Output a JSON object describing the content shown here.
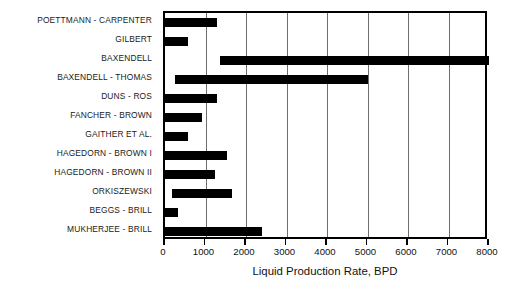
{
  "chart_data": {
    "type": "bar",
    "orientation": "horizontal",
    "title": "",
    "xlabel": "Liquid Production Rate, BPD",
    "ylabel": "",
    "xlim": [
      0,
      8000
    ],
    "xticks": [
      0,
      1000,
      2000,
      3000,
      4000,
      5000,
      6000,
      7000,
      8000
    ],
    "xticklabels": [
      "0",
      "1000",
      "2000",
      "3000",
      "4000",
      "5000",
      "6000",
      "7000",
      "8000"
    ],
    "grid": "vertical",
    "legend": "none",
    "bar_color": "#000000",
    "categories": [
      "POETTMANN - CARPENTER",
      "GILBERT",
      "BAXENDELL",
      "BAXENDELL - THOMAS",
      "DUNS - ROS",
      "FANCHER - BROWN",
      "GAITHER ET AL.",
      "HAGEDORN - BROWN I",
      "HAGEDORN - BROWN II",
      "ORKISZEWSKI",
      "BEGGS - BRILL",
      "MUKHERJEE - BRILL"
    ],
    "ranges": [
      {
        "category": "POETTMANN - CARPENTER",
        "low": 0,
        "high": 1290
      },
      {
        "category": "GILBERT",
        "low": 0,
        "high": 570
      },
      {
        "category": "BAXENDELL",
        "low": 1360,
        "high": 8000
      },
      {
        "category": "BAXENDELL - THOMAS",
        "low": 250,
        "high": 5000
      },
      {
        "category": "DUNS - ROS",
        "low": 0,
        "high": 1280
      },
      {
        "category": "FANCHER - BROWN",
        "low": 0,
        "high": 910
      },
      {
        "category": "GAITHER ET AL.",
        "low": 0,
        "high": 570
      },
      {
        "category": "HAGEDORN - BROWN I",
        "low": 0,
        "high": 1530
      },
      {
        "category": "HAGEDORN - BROWN II",
        "low": 0,
        "high": 1240
      },
      {
        "category": "ORKISZEWSKI",
        "low": 180,
        "high": 1650
      },
      {
        "category": "BEGGS - BRILL",
        "low": 0,
        "high": 320
      },
      {
        "category": "MUKHERJEE - BRILL",
        "low": 0,
        "high": 2400
      }
    ],
    "values": [
      1290,
      570,
      8000,
      5000,
      1280,
      910,
      570,
      1530,
      1240,
      1650,
      320,
      2400
    ]
  }
}
